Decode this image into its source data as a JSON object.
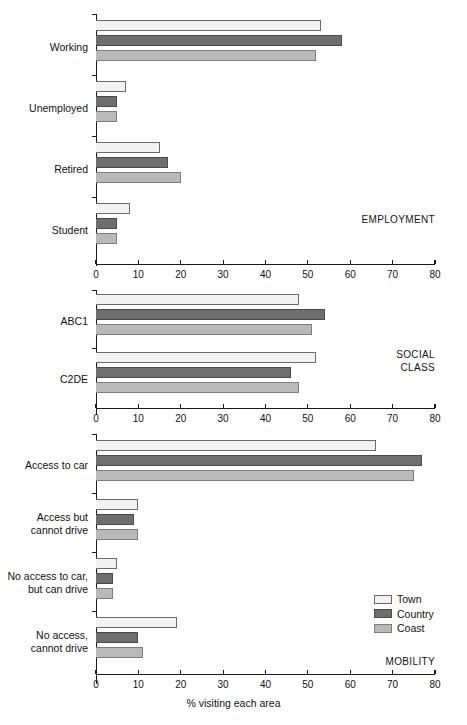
{
  "chart_data": {
    "type": "bar",
    "orientation": "horizontal",
    "title": "",
    "xlabel": "% visiting each area",
    "ylabel": "",
    "xlim": [
      0,
      80
    ],
    "xticks": [
      0,
      10,
      20,
      30,
      40,
      50,
      60,
      70,
      80
    ],
    "grid": false,
    "legend": {
      "position": "lower-right",
      "entries": [
        {
          "name": "Town",
          "color": "#f2f2f2"
        },
        {
          "name": "Country",
          "color": "#6e6e6e"
        },
        {
          "name": "Coast",
          "color": "#b9b9b9"
        }
      ]
    },
    "series_names": [
      "Town",
      "Country",
      "Coast"
    ],
    "panels": [
      {
        "caption": "EMPLOYMENT",
        "categories": [
          "Working",
          "Unemployed",
          "Retired",
          "Student"
        ],
        "series": [
          {
            "name": "Town",
            "values": [
              53,
              7,
              15,
              8
            ]
          },
          {
            "name": "Country",
            "values": [
              58,
              5,
              17,
              5
            ]
          },
          {
            "name": "Coast",
            "values": [
              52,
              5,
              20,
              5
            ]
          }
        ]
      },
      {
        "caption": "SOCIAL\nCLASS",
        "categories": [
          "ABC1",
          "C2DE"
        ],
        "series": [
          {
            "name": "Town",
            "values": [
              48,
              52
            ]
          },
          {
            "name": "Country",
            "values": [
              54,
              46
            ]
          },
          {
            "name": "Coast",
            "values": [
              51,
              48
            ]
          }
        ]
      },
      {
        "caption": "MOBILITY",
        "categories": [
          "Access to car",
          "Access but\ncannot drive",
          "No access to car,\nbut can drive",
          "No access,\ncannot drive"
        ],
        "series": [
          {
            "name": "Town",
            "values": [
              66,
              10,
              5,
              19
            ]
          },
          {
            "name": "Country",
            "values": [
              77,
              9,
              4,
              10
            ]
          },
          {
            "name": "Coast",
            "values": [
              75,
              10,
              4,
              11
            ]
          }
        ]
      }
    ]
  },
  "axis": {
    "xlabel": "% visiting each area",
    "tick_labels": [
      "0",
      "10",
      "20",
      "30",
      "40",
      "50",
      "60",
      "70",
      "80"
    ]
  },
  "legend": {
    "town": "Town",
    "country": "Country",
    "coast": "Coast"
  },
  "captions": {
    "employment": "EMPLOYMENT",
    "social_class": "SOCIAL\nCLASS",
    "mobility": "MOBILITY"
  },
  "layout": {
    "panels": [
      {
        "key": "employment",
        "top": 14,
        "height": 250,
        "axis_y": 250,
        "group_gap": 59.5,
        "first_group_top": 6
      },
      {
        "key": "social_class",
        "top": 290,
        "height": 120,
        "axis_y": 118,
        "group_gap": 56,
        "first_group_top": 4
      },
      {
        "key": "mobility",
        "top": 434,
        "height": 250,
        "axis_y": 240,
        "group_gap": 56.5,
        "first_group_top": 6
      }
    ],
    "caption_positions": [
      {
        "key": "employment",
        "top": 212,
        "right": 32
      },
      {
        "key": "social_class",
        "top": 350,
        "right": 32
      },
      {
        "key": "mobility",
        "top": 656,
        "right": 32
      }
    ]
  }
}
